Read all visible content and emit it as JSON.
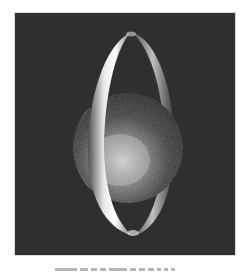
{
  "figure": {
    "background_color": "#2f2f2f",
    "page_background": "#ffffff",
    "sphere": {
      "cx": 128,
      "cy": 148,
      "r": 55
    },
    "ring": {
      "cx": 131,
      "cy": 134,
      "rx": 43,
      "ry": 102
    },
    "caption_text": ""
  }
}
